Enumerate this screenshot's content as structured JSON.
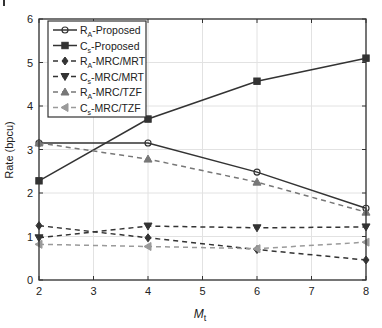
{
  "chart_data": {
    "type": "line",
    "title": "",
    "xlabel": "M",
    "xlabel_sub": "t",
    "ylabel": "Rate (bpcu)",
    "xlim": [
      2,
      8
    ],
    "ylim": [
      0,
      6
    ],
    "xticks": [
      2,
      3,
      4,
      5,
      6,
      7,
      8
    ],
    "yticks": [
      0,
      1,
      2,
      3,
      4,
      5,
      6
    ],
    "grid": true,
    "legend_position": "upper-left",
    "x": [
      2,
      4,
      6,
      8
    ],
    "series": [
      {
        "name": "R_A-Proposed",
        "label_main": "R",
        "label_sub": "A",
        "label_rest": "-Proposed",
        "values": [
          3.15,
          3.15,
          2.48,
          1.65
        ],
        "marker": "circle",
        "dash": "solid",
        "color": "#333333"
      },
      {
        "name": "C_s-Proposed",
        "label_main": "C",
        "label_sub": "s",
        "label_rest": "-Proposed",
        "values": [
          2.28,
          3.7,
          4.57,
          5.1
        ],
        "marker": "square",
        "dash": "solid",
        "color": "#333333"
      },
      {
        "name": "R_A-MRC/MRT",
        "label_main": "R",
        "label_sub": "A",
        "label_rest": "-MRC/MRT",
        "values": [
          1.25,
          0.97,
          0.7,
          0.46
        ],
        "marker": "diamond",
        "dash": "dashed",
        "color": "#333333"
      },
      {
        "name": "C_s-MRC/MRT",
        "label_main": "C",
        "label_sub": "s",
        "label_rest": "-MRC/MRT",
        "values": [
          0.97,
          1.24,
          1.2,
          1.22
        ],
        "marker": "triangle-down",
        "dash": "dashed",
        "color": "#333333"
      },
      {
        "name": "R_A-MRC/TZF",
        "label_main": "R",
        "label_sub": "A",
        "label_rest": "-MRC/TZF",
        "values": [
          3.15,
          2.78,
          2.25,
          1.56
        ],
        "marker": "triangle-up",
        "dash": "dashed",
        "color": "#777777"
      },
      {
        "name": "C_s-MRC/TZF",
        "label_main": "C",
        "label_sub": "s",
        "label_rest": "-MRC/TZF",
        "values": [
          0.82,
          0.77,
          0.72,
          0.87
        ],
        "marker": "triangle-left",
        "dash": "dashed",
        "color": "#9a9a9a"
      }
    ]
  },
  "layout": {
    "plot_left": 39,
    "plot_right": 366,
    "plot_top": 19,
    "plot_bottom": 280,
    "legend": {
      "x": 48,
      "y": 21,
      "w": 98,
      "h": 96
    }
  }
}
